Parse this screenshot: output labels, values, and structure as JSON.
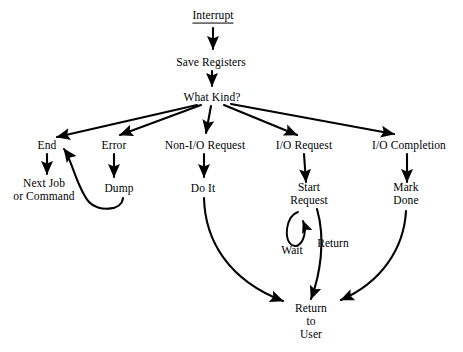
{
  "diagram": {
    "background_color": "#ffffff",
    "stroke_color": "#000000",
    "text_color": "#000000",
    "nodes": [
      {
        "id": "interrupt",
        "lines": [
          "Interrupt"
        ],
        "x": 213,
        "y": 16,
        "underline": true
      },
      {
        "id": "save-registers",
        "lines": [
          "Save Registers"
        ],
        "x": 211,
        "y": 62,
        "underline": false
      },
      {
        "id": "what-kind",
        "lines": [
          "What Kind?"
        ],
        "x": 212,
        "y": 97,
        "underline": false
      },
      {
        "id": "end",
        "lines": [
          "End"
        ],
        "x": 47,
        "y": 145,
        "underline": false
      },
      {
        "id": "error",
        "lines": [
          "Error"
        ],
        "x": 114,
        "y": 145,
        "underline": false
      },
      {
        "id": "non-io-request",
        "lines": [
          "Non-I/O Request"
        ],
        "x": 205,
        "y": 145,
        "underline": false
      },
      {
        "id": "io-request",
        "lines": [
          "I/O Request"
        ],
        "x": 304,
        "y": 145,
        "underline": false
      },
      {
        "id": "io-completion",
        "lines": [
          "I/O Completion"
        ],
        "x": 409,
        "y": 145,
        "underline": false
      },
      {
        "id": "next-job",
        "lines": [
          "Next Job",
          "or Command"
        ],
        "x": 44,
        "y": 190,
        "underline": false
      },
      {
        "id": "dump",
        "lines": [
          "Dump"
        ],
        "x": 119,
        "y": 188,
        "underline": false
      },
      {
        "id": "do-it",
        "lines": [
          "Do It"
        ],
        "x": 203,
        "y": 188,
        "underline": false
      },
      {
        "id": "start-request",
        "lines": [
          "Start",
          "Request"
        ],
        "x": 309,
        "y": 194,
        "underline": false
      },
      {
        "id": "mark-done",
        "lines": [
          "Mark",
          "Done"
        ],
        "x": 406,
        "y": 194,
        "underline": false
      },
      {
        "id": "return-to-user",
        "lines": [
          "Return",
          "to",
          "User"
        ],
        "x": 311,
        "y": 321,
        "underline": false
      }
    ],
    "edge_labels": [
      {
        "id": "wait",
        "text": "Wait",
        "x": 292,
        "y": 250
      },
      {
        "id": "return",
        "text": "Return",
        "x": 333,
        "y": 243
      }
    ],
    "edges": [
      {
        "id": "interrupt-to-save-registers",
        "from": "interrupt",
        "to": "save-registers"
      },
      {
        "id": "save-registers-to-what-kind",
        "from": "save-registers",
        "to": "what-kind"
      },
      {
        "id": "what-kind-to-end",
        "from": "what-kind",
        "to": "end"
      },
      {
        "id": "what-kind-to-error",
        "from": "what-kind",
        "to": "error"
      },
      {
        "id": "what-kind-to-non-io-request",
        "from": "what-kind",
        "to": "non-io-request"
      },
      {
        "id": "what-kind-to-io-request",
        "from": "what-kind",
        "to": "io-request"
      },
      {
        "id": "what-kind-to-io-completion",
        "from": "what-kind",
        "to": "io-completion"
      },
      {
        "id": "end-to-next-job",
        "from": "end",
        "to": "next-job"
      },
      {
        "id": "error-to-dump",
        "from": "error",
        "to": "dump"
      },
      {
        "id": "dump-to-end",
        "from": "dump",
        "to": "end"
      },
      {
        "id": "non-io-request-to-do-it",
        "from": "non-io-request",
        "to": "do-it"
      },
      {
        "id": "io-request-to-start-request",
        "from": "io-request",
        "to": "start-request"
      },
      {
        "id": "io-completion-to-mark-done",
        "from": "io-completion",
        "to": "mark-done"
      },
      {
        "id": "start-request-wait-loop",
        "from": "start-request",
        "to": "start-request",
        "label": "wait"
      },
      {
        "id": "do-it-to-return-to-user",
        "from": "do-it",
        "to": "return-to-user"
      },
      {
        "id": "start-request-to-return-to-user",
        "from": "start-request",
        "to": "return-to-user",
        "label": "return"
      },
      {
        "id": "mark-done-to-return-to-user",
        "from": "mark-done",
        "to": "return-to-user"
      }
    ]
  }
}
